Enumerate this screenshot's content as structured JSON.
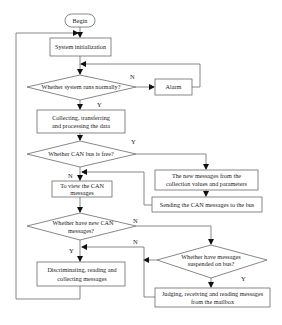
{
  "diagram": {
    "type": "flowchart",
    "nodes": {
      "begin": {
        "label": "Begin",
        "shape": "terminator"
      },
      "init": {
        "label": "System initialization",
        "shape": "process"
      },
      "check_system": {
        "label": "Whether system runs normally?",
        "shape": "decision"
      },
      "alarm": {
        "label": "Alarm",
        "shape": "process"
      },
      "collect": {
        "line1": "Collecting, transferring",
        "line2": "and  processing the data",
        "shape": "process"
      },
      "check_bus": {
        "label": "Whether CAN bus is free?",
        "shape": "decision"
      },
      "new_messages": {
        "line1": "The  new messages from the",
        "line2": "collection values and parameters",
        "shape": "process"
      },
      "send": {
        "label": "Sending  the CAN messages to the bus",
        "shape": "process"
      },
      "view": {
        "line1": "To view the CAN",
        "line2": "messages",
        "shape": "process"
      },
      "check_new": {
        "line1": "Whether have  new CAN",
        "line2": "messages?",
        "shape": "decision"
      },
      "check_suspended": {
        "line1": "Whether have  messages",
        "line2": "suspended on bus?",
        "shape": "decision"
      },
      "discriminate": {
        "line1": "Discriminating, reading and",
        "line2": "collecting messages",
        "shape": "process"
      },
      "judge": {
        "line1": "Judging, receiving and reading messages",
        "line2": "from the mailbox",
        "shape": "process"
      }
    },
    "edge_labels": {
      "system_no": "N",
      "system_yes": "Y",
      "bus_yes": "Y",
      "bus_no": "N",
      "new_no": "N",
      "new_yes": "Y",
      "suspended_no": "N",
      "suspended_yes": "Y"
    },
    "edges": [
      {
        "from": "begin",
        "to": "init"
      },
      {
        "from": "init",
        "to": "check_system"
      },
      {
        "from": "check_system",
        "to": "alarm",
        "label": "N"
      },
      {
        "from": "alarm",
        "to": "check_system"
      },
      {
        "from": "check_system",
        "to": "collect",
        "label": "Y"
      },
      {
        "from": "collect",
        "to": "check_bus"
      },
      {
        "from": "check_bus",
        "to": "new_messages",
        "label": "Y"
      },
      {
        "from": "new_messages",
        "to": "send"
      },
      {
        "from": "send",
        "to": "view"
      },
      {
        "from": "check_bus",
        "to": "view",
        "label": "N"
      },
      {
        "from": "view",
        "to": "check_new"
      },
      {
        "from": "check_new",
        "to": "check_suspended",
        "label": "N"
      },
      {
        "from": "check_new",
        "to": "discriminate",
        "label": "Y"
      },
      {
        "from": "check_suspended",
        "to": "discriminate",
        "label": "N"
      },
      {
        "from": "check_suspended",
        "to": "judge",
        "label": "Y"
      },
      {
        "from": "judge",
        "to": "discriminate"
      },
      {
        "from": "discriminate",
        "to": "init"
      }
    ]
  }
}
